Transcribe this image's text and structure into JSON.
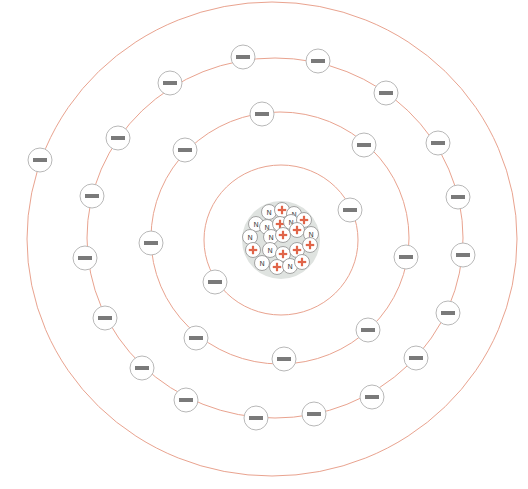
{
  "diagram": {
    "type": "bohr-atom-model",
    "colors": {
      "orbit": "#e9a38f",
      "electron_outline": "#b8b8b8",
      "electron_bar": "#7a7a7a",
      "proton_plus": "#e0654a",
      "neutron_label": "#444444"
    },
    "electron_symbol": "−",
    "neutron_symbol": "N",
    "proton_symbol": "+",
    "electron_radius": 12,
    "nucleon_radius": 7.5,
    "nucleus": {
      "cx": 281,
      "cy": 240,
      "r": 39,
      "particles": [
        {
          "type": "N",
          "x": 269,
          "y": 212
        },
        {
          "type": "+",
          "x": 282,
          "y": 210
        },
        {
          "type": "N",
          "x": 294,
          "y": 214
        },
        {
          "type": "N",
          "x": 256,
          "y": 224
        },
        {
          "type": "N",
          "x": 267,
          "y": 227
        },
        {
          "type": "+",
          "x": 280,
          "y": 224
        },
        {
          "type": "N",
          "x": 291,
          "y": 222
        },
        {
          "type": "+",
          "x": 304,
          "y": 220
        },
        {
          "type": "N",
          "x": 250,
          "y": 237
        },
        {
          "type": "N",
          "x": 271,
          "y": 237
        },
        {
          "type": "+",
          "x": 283,
          "y": 235
        },
        {
          "type": "+",
          "x": 297,
          "y": 230
        },
        {
          "type": "N",
          "x": 311,
          "y": 234
        },
        {
          "type": "+",
          "x": 253,
          "y": 250
        },
        {
          "type": "N",
          "x": 270,
          "y": 250
        },
        {
          "type": "+",
          "x": 283,
          "y": 254
        },
        {
          "type": "+",
          "x": 297,
          "y": 250
        },
        {
          "type": "+",
          "x": 310,
          "y": 245
        },
        {
          "type": "N",
          "x": 262,
          "y": 263
        },
        {
          "type": "+",
          "x": 277,
          "y": 267
        },
        {
          "type": "N",
          "x": 290,
          "y": 266
        },
        {
          "type": "+",
          "x": 302,
          "y": 262
        }
      ]
    },
    "shells": [
      {
        "name": "shell-1",
        "cx": 281,
        "cy": 240,
        "rx": 77,
        "ry": 75,
        "electron_count": 2,
        "electrons": [
          [
            350,
            210
          ],
          [
            215,
            282
          ]
        ]
      },
      {
        "name": "shell-2",
        "cx": 280,
        "cy": 238,
        "rx": 129,
        "ry": 126,
        "electron_count": 8,
        "electrons": [
          [
            262,
            114
          ],
          [
            364,
            145
          ],
          [
            406,
            257
          ],
          [
            368,
            330
          ],
          [
            284,
            359
          ],
          [
            196,
            338
          ],
          [
            151,
            243
          ],
          [
            185,
            150
          ]
        ]
      },
      {
        "name": "shell-3",
        "cx": 275,
        "cy": 238,
        "rx": 188,
        "ry": 180,
        "electron_count": 18,
        "electrons": [
          [
            243,
            57
          ],
          [
            318,
            61
          ],
          [
            386,
            93
          ],
          [
            438,
            143
          ],
          [
            458,
            197
          ],
          [
            463,
            255
          ],
          [
            448,
            313
          ],
          [
            416,
            358
          ],
          [
            372,
            397
          ],
          [
            314,
            414
          ],
          [
            256,
            418
          ],
          [
            186,
            400
          ],
          [
            142,
            368
          ],
          [
            105,
            318
          ],
          [
            85,
            258
          ],
          [
            92,
            196
          ],
          [
            118,
            138
          ],
          [
            170,
            83
          ]
        ]
      },
      {
        "name": "shell-4",
        "cx": 272,
        "cy": 239,
        "rx": 245,
        "ry": 237,
        "electron_count": 1,
        "electrons": [
          [
            40,
            160
          ]
        ]
      }
    ]
  }
}
